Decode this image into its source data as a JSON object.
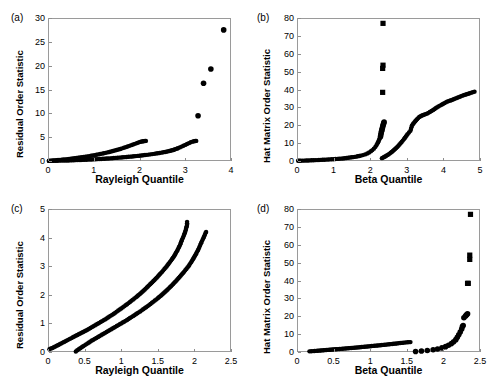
{
  "figure": {
    "background": "#ffffff",
    "marker_color": "#000000",
    "axis_color": "#9a9a9a",
    "width": 498,
    "height": 382
  },
  "panels": [
    {
      "tag": "(a)",
      "xlabel": "Rayleigh Quantile",
      "ylabel": "Residual Order Statistic",
      "xticks": [
        "0",
        "1",
        "2",
        "3",
        "4"
      ],
      "yticks": [
        "0",
        "5",
        "10",
        "15",
        "20",
        "25",
        "30"
      ]
    },
    {
      "tag": "(b)",
      "xlabel": "Beta Quantile",
      "ylabel": "Hat Matrix Order Statistic",
      "xticks": [
        "0",
        "1",
        "2",
        "3",
        "4",
        "5"
      ],
      "yticks": [
        "0",
        "10",
        "20",
        "30",
        "40",
        "50",
        "60",
        "70",
        "80"
      ]
    },
    {
      "tag": "(c)",
      "xlabel": "Rayleigh Quantile",
      "ylabel": "Residual Order Statistic",
      "xticks": [
        "0",
        "0.5",
        "1",
        "1.5",
        "2",
        "2.5"
      ],
      "yticks": [
        "0",
        "1",
        "2",
        "3",
        "4",
        "5"
      ]
    },
    {
      "tag": "(d)",
      "xlabel": "Beta Quantile",
      "ylabel": "Hat Matrix Order Statistic",
      "xticks": [
        "0",
        "0.5",
        "1",
        "1.5",
        "2",
        "2.5"
      ],
      "yticks": [
        "0",
        "10",
        "20",
        "30",
        "40",
        "50",
        "60",
        "70",
        "80"
      ]
    }
  ],
  "chart_data": [
    {
      "type": "scatter",
      "panel": "(a)",
      "title": "",
      "xlabel": "Rayleigh Quantile",
      "ylabel": "Residual Order Statistic",
      "xlim": [
        0,
        4
      ],
      "ylim": [
        0,
        30
      ],
      "xticks": [
        0,
        1,
        2,
        3,
        4
      ],
      "yticks": [
        0,
        5,
        10,
        15,
        20,
        25,
        30
      ],
      "grid": false,
      "legend": null,
      "marker": "circle",
      "series": [
        {
          "name": "branch-upper",
          "x": [
            0.02,
            0.06,
            0.1,
            0.14,
            0.18,
            0.22,
            0.26,
            0.3,
            0.34,
            0.38,
            0.42,
            0.46,
            0.5,
            0.54,
            0.58,
            0.62,
            0.66,
            0.7,
            0.74,
            0.78,
            0.82,
            0.86,
            0.9,
            0.94,
            0.98,
            1.02,
            1.06,
            1.1,
            1.14,
            1.18,
            1.22,
            1.26,
            1.3,
            1.34,
            1.38,
            1.42,
            1.46,
            1.5,
            1.54,
            1.58,
            1.62,
            1.66,
            1.7,
            1.74,
            1.78,
            1.82,
            1.86,
            1.9,
            1.94,
            1.97,
            2.0,
            2.03,
            2.06,
            2.08,
            2.1,
            2.12,
            2.14
          ],
          "y": [
            0.05,
            0.08,
            0.11,
            0.14,
            0.17,
            0.2,
            0.23,
            0.27,
            0.31,
            0.35,
            0.39,
            0.43,
            0.47,
            0.52,
            0.57,
            0.62,
            0.67,
            0.72,
            0.78,
            0.84,
            0.9,
            0.96,
            1.02,
            1.09,
            1.16,
            1.23,
            1.3,
            1.38,
            1.46,
            1.54,
            1.62,
            1.71,
            1.8,
            1.89,
            1.99,
            2.09,
            2.19,
            2.3,
            2.41,
            2.53,
            2.65,
            2.78,
            2.91,
            3.04,
            3.18,
            3.32,
            3.46,
            3.6,
            3.74,
            3.86,
            3.96,
            4.04,
            4.11,
            4.15,
            4.18,
            4.2,
            4.22
          ]
        },
        {
          "name": "branch-lower",
          "x": [
            0.02,
            0.08,
            0.16,
            0.24,
            0.32,
            0.4,
            0.48,
            0.56,
            0.64,
            0.72,
            0.8,
            0.88,
            0.96,
            1.04,
            1.12,
            1.2,
            1.28,
            1.36,
            1.44,
            1.52,
            1.6,
            1.68,
            1.76,
            1.84,
            1.92,
            2.0,
            2.08,
            2.16,
            2.24,
            2.32,
            2.4,
            2.48,
            2.56,
            2.62,
            2.68,
            2.74,
            2.79,
            2.84,
            2.88,
            2.92,
            2.96,
            3.0,
            3.04,
            3.08,
            3.12,
            3.16,
            3.19,
            3.22,
            3.24
          ],
          "y": [
            0.02,
            0.03,
            0.05,
            0.07,
            0.09,
            0.11,
            0.13,
            0.16,
            0.19,
            0.22,
            0.25,
            0.29,
            0.33,
            0.37,
            0.41,
            0.46,
            0.51,
            0.56,
            0.62,
            0.68,
            0.74,
            0.81,
            0.88,
            0.95,
            1.03,
            1.11,
            1.2,
            1.29,
            1.39,
            1.5,
            1.62,
            1.75,
            1.9,
            2.02,
            2.16,
            2.32,
            2.5,
            2.68,
            2.85,
            3.02,
            3.2,
            3.38,
            3.56,
            3.74,
            3.92,
            4.06,
            4.14,
            4.19,
            4.22
          ]
        },
        {
          "name": "outliers",
          "x": [
            3.28,
            3.4,
            3.56,
            3.84
          ],
          "y": [
            9.5,
            16.3,
            19.3,
            27.5
          ]
        }
      ]
    },
    {
      "type": "scatter",
      "panel": "(b)",
      "title": "",
      "xlabel": "Beta Quantile",
      "ylabel": "Hat Matrix Order Statistic",
      "xlim": [
        0,
        5
      ],
      "ylim": [
        0,
        80
      ],
      "xticks": [
        0,
        1,
        2,
        3,
        4,
        5
      ],
      "yticks": [
        0,
        10,
        20,
        30,
        40,
        50,
        60,
        70,
        80
      ],
      "grid": false,
      "legend": null,
      "marker": "circle",
      "series": [
        {
          "name": "baseline",
          "x": [
            0.03,
            0.1,
            0.2,
            0.3,
            0.4,
            0.5,
            0.6,
            0.7,
            0.8,
            0.9,
            1.0,
            1.1,
            1.2,
            1.3,
            1.4,
            1.5,
            1.58,
            1.66,
            1.74,
            1.8,
            1.86,
            1.92,
            1.97,
            2.02,
            2.06,
            2.1,
            2.14,
            2.17,
            2.2,
            2.23,
            2.26
          ],
          "y": [
            0.1,
            0.15,
            0.22,
            0.3,
            0.38,
            0.47,
            0.56,
            0.66,
            0.77,
            0.89,
            1.02,
            1.17,
            1.34,
            1.54,
            1.78,
            2.06,
            2.32,
            2.62,
            2.98,
            3.3,
            3.7,
            4.2,
            4.75,
            5.45,
            6.1,
            6.9,
            7.9,
            8.8,
            9.9,
            11.2,
            12.6
          ]
        },
        {
          "name": "steep-branch",
          "x": [
            2.28,
            2.29,
            2.3,
            2.31,
            2.32,
            2.33,
            2.34,
            2.35,
            2.36,
            2.37,
            2.38
          ],
          "y": [
            13.6,
            14.6,
            15.6,
            16.6,
            17.4,
            18.2,
            19.0,
            19.8,
            20.5,
            21.2,
            21.8
          ]
        },
        {
          "name": "right-branch",
          "x": [
            2.32,
            2.38,
            2.44,
            2.5,
            2.56,
            2.62,
            2.68,
            2.74,
            2.8,
            2.86,
            2.92,
            2.97,
            3.02,
            3.06,
            3.1,
            3.14,
            3.18,
            3.23,
            3.28,
            3.34,
            3.4,
            3.47,
            3.55,
            3.63,
            3.72,
            3.82,
            3.95,
            4.1,
            4.25,
            4.55,
            4.85
          ],
          "y": [
            1.6,
            2.2,
            2.9,
            3.7,
            4.6,
            5.6,
            6.7,
            7.9,
            9.2,
            10.6,
            12.2,
            13.6,
            15.0,
            16.0,
            16.9,
            19.8,
            21.0,
            22.2,
            23.4,
            24.6,
            25.3,
            25.9,
            26.5,
            27.4,
            28.5,
            30.0,
            31.5,
            33.2,
            34.3,
            36.8,
            38.8
          ]
        },
        {
          "name": "outliers",
          "x": [
            2.34,
            2.34,
            2.35,
            2.35
          ],
          "y": [
            38.4,
            51.8,
            53.6,
            77.0
          ],
          "marker": "square"
        }
      ]
    },
    {
      "type": "scatter",
      "panel": "(c)",
      "title": "",
      "xlabel": "Rayleigh Quantile",
      "ylabel": "Residual Order Statistic",
      "xlim": [
        0,
        2.5
      ],
      "ylim": [
        0,
        5
      ],
      "xticks": [
        0,
        0.5,
        1,
        1.5,
        2,
        2.5
      ],
      "yticks": [
        0,
        1,
        2,
        3,
        4,
        5
      ],
      "grid": false,
      "legend": null,
      "marker": "circle",
      "series": [
        {
          "name": "branch-left",
          "x": [
            0.02,
            0.06,
            0.12,
            0.18,
            0.24,
            0.3,
            0.36,
            0.42,
            0.48,
            0.54,
            0.6,
            0.66,
            0.72,
            0.78,
            0.84,
            0.9,
            0.96,
            1.02,
            1.08,
            1.14,
            1.2,
            1.26,
            1.32,
            1.38,
            1.44,
            1.5,
            1.56,
            1.62,
            1.67,
            1.72,
            1.76,
            1.8,
            1.83,
            1.86,
            1.88,
            1.89,
            1.9,
            1.9
          ],
          "y": [
            0.1,
            0.14,
            0.22,
            0.3,
            0.38,
            0.46,
            0.54,
            0.62,
            0.7,
            0.78,
            0.87,
            0.96,
            1.05,
            1.14,
            1.24,
            1.34,
            1.45,
            1.56,
            1.67,
            1.79,
            1.91,
            2.04,
            2.18,
            2.33,
            2.48,
            2.64,
            2.81,
            2.99,
            3.16,
            3.34,
            3.52,
            3.72,
            3.92,
            4.1,
            4.25,
            4.35,
            4.45,
            4.55
          ]
        },
        {
          "name": "branch-right",
          "x": [
            0.38,
            0.42,
            0.48,
            0.54,
            0.6,
            0.66,
            0.72,
            0.78,
            0.84,
            0.9,
            0.96,
            1.02,
            1.08,
            1.14,
            1.2,
            1.26,
            1.32,
            1.38,
            1.44,
            1.5,
            1.56,
            1.62,
            1.68,
            1.74,
            1.8,
            1.86,
            1.92,
            1.97,
            2.02,
            2.06,
            2.09,
            2.12,
            2.14,
            2.15,
            2.16
          ],
          "y": [
            0.02,
            0.1,
            0.2,
            0.3,
            0.4,
            0.49,
            0.58,
            0.67,
            0.76,
            0.85,
            0.94,
            1.03,
            1.12,
            1.22,
            1.32,
            1.42,
            1.53,
            1.64,
            1.76,
            1.88,
            2.01,
            2.15,
            2.3,
            2.46,
            2.63,
            2.81,
            3.0,
            3.2,
            3.42,
            3.62,
            3.8,
            3.97,
            4.08,
            4.15,
            4.2
          ]
        }
      ]
    },
    {
      "type": "scatter",
      "panel": "(d)",
      "title": "",
      "xlabel": "Beta Quantile",
      "ylabel": "Hat Matrix Order Statistic",
      "xlim": [
        0,
        2.5
      ],
      "ylim": [
        0,
        80
      ],
      "xticks": [
        0,
        0.5,
        1,
        1.5,
        2,
        2.5
      ],
      "yticks": [
        0,
        10,
        20,
        30,
        40,
        50,
        60,
        70,
        80
      ],
      "grid": false,
      "legend": null,
      "marker": "circle",
      "series": [
        {
          "name": "flat-branch",
          "x": [
            0.17,
            0.22,
            0.28,
            0.34,
            0.4,
            0.46,
            0.52,
            0.58,
            0.64,
            0.7,
            0.76,
            0.82,
            0.88,
            0.94,
            1.0,
            1.06,
            1.12,
            1.18,
            1.24,
            1.3,
            1.36,
            1.41,
            1.45,
            1.48,
            1.51,
            1.53,
            1.55
          ],
          "y": [
            0.35,
            0.5,
            0.7,
            0.9,
            1.1,
            1.3,
            1.5,
            1.7,
            1.9,
            2.1,
            2.32,
            2.54,
            2.76,
            3.0,
            3.24,
            3.48,
            3.72,
            3.98,
            4.24,
            4.5,
            4.76,
            5.0,
            5.18,
            5.32,
            5.42,
            5.5,
            5.55
          ]
        },
        {
          "name": "rising-branch",
          "x": [
            1.62,
            1.7,
            1.78,
            1.86,
            1.92,
            1.98,
            2.03,
            2.07,
            2.11,
            2.14,
            2.17,
            2.19,
            2.21,
            2.23,
            2.25,
            2.26,
            2.27,
            2.28,
            2.3,
            2.31,
            2.32,
            2.33
          ],
          "y": [
            0.3,
            0.55,
            0.85,
            1.25,
            1.7,
            2.3,
            3.0,
            3.8,
            4.7,
            5.7,
            6.9,
            8.2,
            9.6,
            11.2,
            12.9,
            14.2,
            14.8,
            19.2,
            20.0,
            20.6,
            21.0,
            21.4
          ]
        },
        {
          "name": "outliers",
          "x": [
            2.33,
            2.34,
            2.36,
            2.36,
            2.37
          ],
          "y": [
            38.4,
            38.4,
            51.8,
            54.2,
            77.0
          ],
          "marker": "square"
        }
      ]
    }
  ]
}
